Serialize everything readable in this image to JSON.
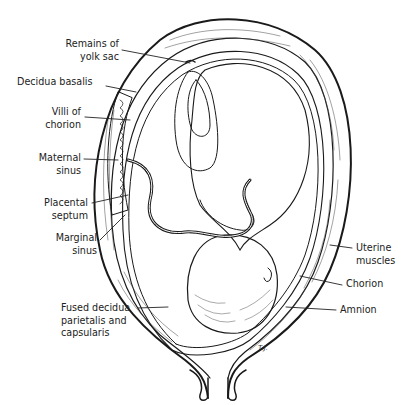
{
  "figure": {
    "signature": "T.J."
  },
  "labels": {
    "yolk_sac": [
      "Remains of",
      "yolk sac"
    ],
    "decidua_basalis": [
      "Decidua basalis"
    ],
    "villi": [
      "Villi of",
      "chorion"
    ],
    "maternal_sinus": [
      "Maternal",
      "sinus"
    ],
    "placental_septum": [
      "Placental",
      "septum"
    ],
    "marginal_sinus": [
      "Marginal",
      "sinus"
    ],
    "fused_decidua": [
      "Fused decidua",
      "parietalis and",
      "capsularis"
    ],
    "uterine_muscles": [
      "Uterine",
      "muscles"
    ],
    "chorion": [
      "Chorion"
    ],
    "amnion": [
      "Amnion"
    ]
  },
  "colors": {
    "ink": "#1a1a1a",
    "paper": "#ffffff"
  }
}
